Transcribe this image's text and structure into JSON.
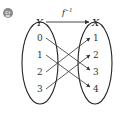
{
  "badge": {
    "label": "답",
    "color": "#777777"
  },
  "domain_set": {
    "name": "Y",
    "elements": [
      "0",
      "1",
      "2",
      "3"
    ]
  },
  "codomain_set": {
    "name": "X",
    "elements": [
      "1",
      "2",
      "3",
      "4"
    ]
  },
  "function_label": {
    "name": "f",
    "superscript": "−1"
  },
  "mappings": [
    {
      "from": "0",
      "to": "3"
    },
    {
      "from": "1",
      "to": "4"
    },
    {
      "from": "2",
      "to": "1"
    },
    {
      "from": "3",
      "to": "2"
    }
  ]
}
